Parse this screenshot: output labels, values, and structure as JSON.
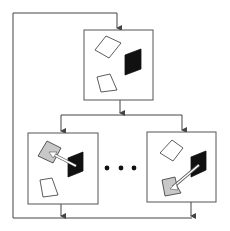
{
  "diagram": {
    "colors": {
      "line": "#444444",
      "frame": "#555555",
      "dark_shape": "#111111",
      "highlight_shape": "#c8c8c8",
      "outline_shape": "#333333",
      "background": "#ffffff"
    },
    "nodes": [
      {
        "id": "top-scene",
        "label": "",
        "shapes": [
          "white-quad-top",
          "white-quad-bottom",
          "black-quad"
        ]
      },
      {
        "id": "candidate-left",
        "label": "",
        "shapes": [
          "gray-quad-selected",
          "white-quad",
          "black-quad",
          "arrow-to-black"
        ]
      },
      {
        "id": "candidate-right",
        "label": "",
        "shapes": [
          "white-quad",
          "gray-quad-selected",
          "black-quad",
          "arrow-to-black"
        ]
      }
    ],
    "ellipsis": "• • •",
    "edges": [
      {
        "from": "feedback-loop",
        "to": "top-scene"
      },
      {
        "from": "top-scene",
        "to": "candidate-left"
      },
      {
        "from": "top-scene",
        "to": "candidate-right"
      },
      {
        "from": "candidate-left",
        "to": "feedback-loop"
      },
      {
        "from": "candidate-right",
        "to": "feedback-loop"
      }
    ]
  }
}
